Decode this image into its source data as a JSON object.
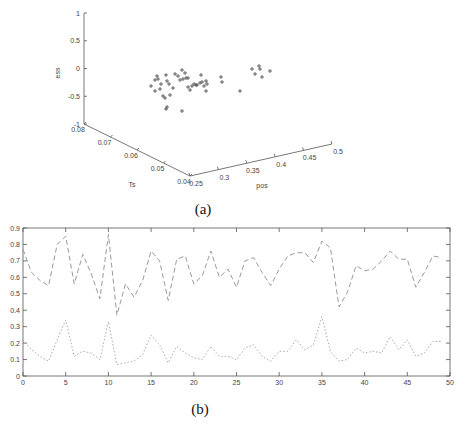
{
  "figure": {
    "caption_a": "(a)",
    "caption_b": "(b)"
  },
  "chart_data": [
    {
      "type": "scatter",
      "subtype": "3d",
      "title": "",
      "xlabel": "pos",
      "ylabel": "Ts",
      "zlabel": "ess",
      "x_ticks": [
        "0.25",
        "0.3",
        "0.35",
        "0.4",
        "0.45",
        "0.5"
      ],
      "y_ticks": [
        "0.04",
        "0.05",
        "0.06",
        "0.07",
        "0.08"
      ],
      "z_ticks": [
        "-1",
        "-0.5",
        "0",
        "0.5",
        "1"
      ],
      "xlim": [
        0.25,
        0.5
      ],
      "ylim": [
        0.04,
        0.08
      ],
      "zlim": [
        -1,
        1
      ],
      "marker": "+",
      "grid": false,
      "projected_points_px": [
        [
          151,
          86
        ],
        [
          155,
          80
        ],
        [
          155,
          91
        ],
        [
          157,
          76
        ],
        [
          158,
          79
        ],
        [
          161,
          84
        ],
        [
          160,
          89
        ],
        [
          163,
          96
        ],
        [
          165,
          98
        ],
        [
          166,
          75
        ],
        [
          167,
          81
        ],
        [
          169,
          84
        ],
        [
          170,
          95
        ],
        [
          173,
          88
        ],
        [
          167,
          107
        ],
        [
          166,
          109
        ],
        [
          175,
          74
        ],
        [
          178,
          76
        ],
        [
          180,
          80
        ],
        [
          183,
          79
        ],
        [
          182,
          70
        ],
        [
          185,
          73
        ],
        [
          186,
          78
        ],
        [
          188,
          78
        ],
        [
          188,
          87
        ],
        [
          190,
          90
        ],
        [
          192,
          86
        ],
        [
          194,
          84
        ],
        [
          196,
          85
        ],
        [
          197,
          85
        ],
        [
          200,
          83
        ],
        [
          202,
          82
        ],
        [
          201,
          75
        ],
        [
          204,
          86
        ],
        [
          206,
          91
        ],
        [
          206,
          81
        ],
        [
          207,
          84
        ],
        [
          221,
          77
        ],
        [
          222,
          82
        ],
        [
          182,
          111
        ],
        [
          240,
          91
        ],
        [
          255,
          74
        ],
        [
          252,
          69
        ],
        [
          260,
          69
        ],
        [
          262,
          77
        ],
        [
          259,
          66
        ],
        [
          270,
          71
        ]
      ]
    },
    {
      "type": "line",
      "title": "",
      "xlabel": "",
      "ylabel": "",
      "xlim": [
        0,
        50
      ],
      "ylim": [
        0,
        0.9
      ],
      "x_ticks": [
        "0",
        "5",
        "10",
        "15",
        "20",
        "25",
        "30",
        "35",
        "40",
        "45",
        "50"
      ],
      "y_ticks": [
        "0",
        "0.1",
        "0.2",
        "0.3",
        "0.4",
        "0.5",
        "0.6",
        "0.7",
        "0.8",
        "0.9"
      ],
      "grid": false,
      "legend": null,
      "x": [
        0,
        1,
        2,
        3,
        4,
        5,
        6,
        7,
        8,
        9,
        10,
        11,
        12,
        13,
        14,
        15,
        16,
        17,
        18,
        19,
        20,
        21,
        22,
        23,
        24,
        25,
        26,
        27,
        28,
        29,
        30,
        31,
        32,
        33,
        34,
        35,
        36,
        37,
        38,
        39,
        40,
        41,
        42,
        43,
        44,
        45,
        46,
        47,
        48,
        49
      ],
      "series": [
        {
          "name": "upper (dashed)",
          "style": "dashed",
          "values": [
            0.77,
            0.63,
            0.58,
            0.55,
            0.8,
            0.85,
            0.56,
            0.74,
            0.62,
            0.47,
            0.86,
            0.37,
            0.56,
            0.48,
            0.58,
            0.76,
            0.7,
            0.46,
            0.71,
            0.73,
            0.56,
            0.61,
            0.76,
            0.6,
            0.65,
            0.54,
            0.7,
            0.72,
            0.63,
            0.55,
            0.65,
            0.73,
            0.75,
            0.75,
            0.69,
            0.82,
            0.78,
            0.42,
            0.51,
            0.67,
            0.64,
            0.65,
            0.7,
            0.76,
            0.71,
            0.71,
            0.54,
            0.63,
            0.73,
            0.72
          ]
        },
        {
          "name": "lower (dotted)",
          "style": "dotted",
          "values": [
            0.22,
            0.16,
            0.12,
            0.09,
            0.22,
            0.34,
            0.12,
            0.15,
            0.14,
            0.1,
            0.33,
            0.07,
            0.08,
            0.09,
            0.13,
            0.25,
            0.19,
            0.08,
            0.18,
            0.14,
            0.11,
            0.1,
            0.18,
            0.12,
            0.12,
            0.1,
            0.17,
            0.19,
            0.12,
            0.09,
            0.15,
            0.15,
            0.22,
            0.16,
            0.19,
            0.36,
            0.15,
            0.09,
            0.1,
            0.17,
            0.14,
            0.15,
            0.14,
            0.24,
            0.16,
            0.22,
            0.12,
            0.14,
            0.21,
            0.21
          ]
        }
      ]
    }
  ]
}
